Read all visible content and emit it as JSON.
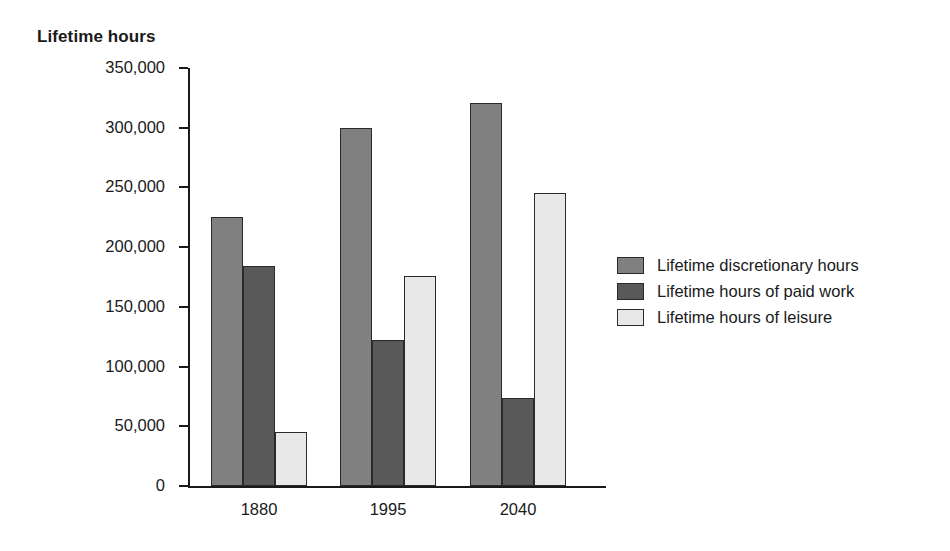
{
  "chart_data": {
    "type": "bar",
    "title": "",
    "ylabel": "Lifetime hours",
    "xlabel": "",
    "categories": [
      "1880",
      "1995",
      "2040"
    ],
    "series": [
      {
        "name": "Lifetime discretionary hours",
        "color": "#808080",
        "values": [
          225000,
          300000,
          321000
        ]
      },
      {
        "name": "Lifetime hours of paid work",
        "color": "#595959",
        "values": [
          184000,
          122000,
          74000
        ]
      },
      {
        "name": "Lifetime hours of leisure",
        "color": "#e8e8e8",
        "values": [
          45000,
          176000,
          245000
        ]
      }
    ],
    "ylim": [
      0,
      350000
    ],
    "yticks": [
      0,
      50000,
      100000,
      150000,
      200000,
      250000,
      300000,
      350000
    ],
    "ytick_labels": [
      "0",
      "50,000",
      "100,000",
      "150,000",
      "200,000",
      "250,000",
      "300,000",
      "350,000"
    ],
    "grid": false,
    "legend_position": "right"
  },
  "legend": {
    "entries": [
      {
        "label": "Lifetime discretionary hours",
        "color": "#808080"
      },
      {
        "label": "Lifetime hours of paid work",
        "color": "#595959"
      },
      {
        "label": "Lifetime hours of leisure",
        "color": "#e8e8e8"
      }
    ]
  }
}
